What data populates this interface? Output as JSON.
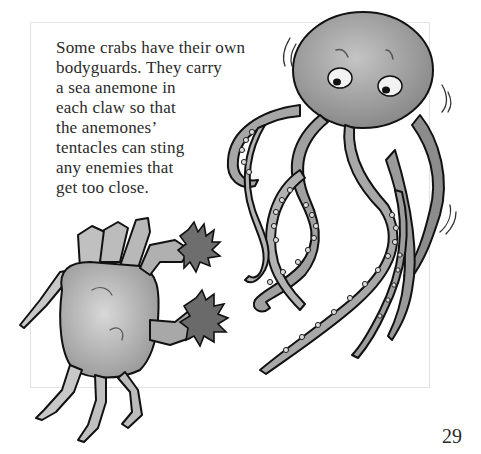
{
  "page": {
    "text_lines": [
      "Some crabs have their own",
      "bodyguards. They carry",
      "a sea anemone in",
      "each claw so that",
      "the anemones’",
      "tentacles can sting",
      "any enemies that",
      "get too close."
    ],
    "page_number": "29",
    "illustration": {
      "subjects": [
        "crab",
        "octopus",
        "sea-anemone",
        "sea-anemone"
      ],
      "style": "grayscale watercolor"
    }
  }
}
